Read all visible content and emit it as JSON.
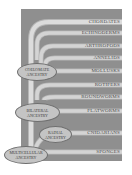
{
  "diagram": {
    "type": "phylogenetic-tree",
    "colors": {
      "panel": "#8f8f8f",
      "branch": "#d9d9d9",
      "branch_edge": "#b5b5b5",
      "label_text": "#4a4a4a",
      "oval_fill": "#c4c4c4"
    },
    "taxa": [
      {
        "label": "CHORDATES"
      },
      {
        "label": "ECHINODERMS"
      },
      {
        "label": "ARTHROPODS"
      },
      {
        "label": "ANNELIDS"
      },
      {
        "label": "MOLLUSKS"
      },
      {
        "label": "ROTIFERS"
      },
      {
        "label": "ROUNDWORMS"
      },
      {
        "label": "FLATWORMS"
      },
      {
        "label": "CNIDARIANS"
      },
      {
        "label": "SPONGES"
      }
    ],
    "ancestors": [
      {
        "line1": "COELOMATE",
        "line2": "ANCESTRY"
      },
      {
        "line1": "BILATERAL",
        "line2": "ANCESTRY"
      },
      {
        "line1": "RADIAL",
        "line2": "ANCESTRY"
      },
      {
        "line1": "MULTICELLULAR",
        "line2": "ANCESTRY"
      }
    ]
  }
}
